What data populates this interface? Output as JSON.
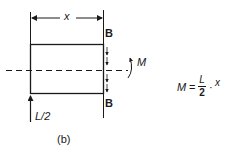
{
  "diagram": {
    "dimension_label": "x",
    "section_label_top": "B",
    "section_label_bottom": "B",
    "moment_label": "M",
    "reaction_label": "L/2",
    "caption": "(b)",
    "equation": {
      "lhs": "M",
      "equals": "=",
      "numerator": "L",
      "denominator": "2",
      "dot": "·",
      "variable": "x"
    }
  }
}
